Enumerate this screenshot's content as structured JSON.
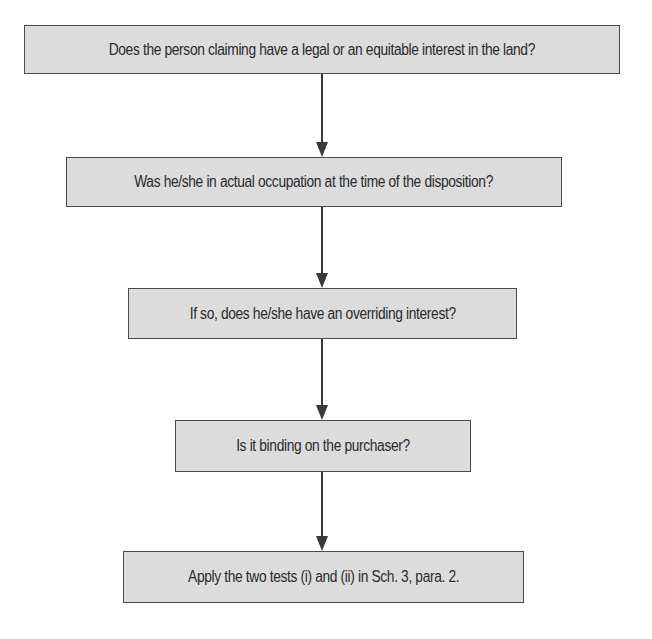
{
  "diagram": {
    "type": "flowchart",
    "colors": {
      "box_fill": "#dcdcdc",
      "box_border": "#4a4a4a",
      "arrow": "#3a3a3a",
      "text": "#2a2a2a"
    },
    "nodes": [
      {
        "id": "n1",
        "label": "Does the person claiming have a legal or an equitable interest in the land?"
      },
      {
        "id": "n2",
        "label": "Was he/she in actual occupation at the time of the disposition?"
      },
      {
        "id": "n3",
        "label": "If so, does he/she have an overriding interest?"
      },
      {
        "id": "n4",
        "label": "Is it binding on the purchaser?"
      },
      {
        "id": "n5",
        "label": "Apply the two tests (i) and (ii) in Sch. 3, para. 2."
      }
    ],
    "edges": [
      {
        "from": "n1",
        "to": "n2"
      },
      {
        "from": "n2",
        "to": "n3"
      },
      {
        "from": "n3",
        "to": "n4"
      },
      {
        "from": "n4",
        "to": "n5"
      }
    ]
  }
}
